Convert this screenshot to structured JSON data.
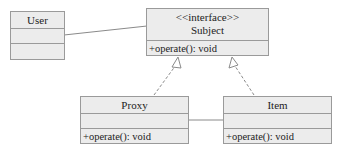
{
  "classes": {
    "user": {
      "name": "User",
      "attributes": [],
      "operations": []
    },
    "subject": {
      "stereotype": "<<interface>>",
      "name": "Subject",
      "operations": [
        "+operate(): void"
      ]
    },
    "proxy": {
      "name": "Proxy",
      "attributes": [],
      "operations": [
        "+operate(): void"
      ]
    },
    "item": {
      "name": "Item",
      "attributes": [],
      "operations": [
        "+operate(): void"
      ]
    }
  },
  "relationships": [
    {
      "type": "association",
      "from": "User",
      "to": "Subject"
    },
    {
      "type": "realization",
      "from": "Proxy",
      "to": "Subject"
    },
    {
      "type": "realization",
      "from": "Item",
      "to": "Subject"
    },
    {
      "type": "association",
      "from": "Proxy",
      "to": "Item"
    }
  ],
  "colors": {
    "box_fill": "#ececec",
    "box_border": "#9a9a9a",
    "line": "#8a8a8a"
  }
}
